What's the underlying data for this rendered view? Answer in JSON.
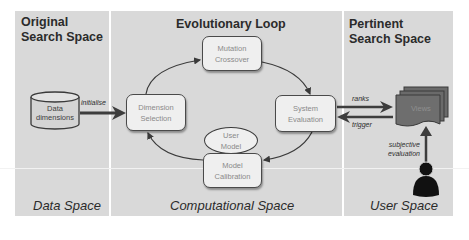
{
  "panels": {
    "data": {
      "title_line1": "Original",
      "title_line2": "Search Space",
      "footer": "Data Space"
    },
    "computational": {
      "title": "Evolutionary Loop",
      "footer": "Computational Space"
    },
    "user": {
      "title_line1": "Pertinent",
      "title_line2": "Search Space",
      "footer": "User Space"
    }
  },
  "nodes": {
    "data_dimensions": {
      "line1": "Data",
      "line2": "dimensions",
      "shape": "cylinder"
    },
    "dimension_selection": {
      "line1": "Dimension",
      "line2": "Selection"
    },
    "mutation_crossover": {
      "line1": "Mutation",
      "line2": "Crossover"
    },
    "system_evaluation": {
      "line1": "System",
      "line2": "Evaluation"
    },
    "user_model": {
      "line1": "User",
      "line2": "Model",
      "shape": "ellipse"
    },
    "model_calibration": {
      "line1": "Model",
      "line2": "Calibration"
    },
    "views": {
      "label": "Views",
      "shape": "stacked-documents"
    },
    "user": {
      "icon": "person-icon"
    }
  },
  "edges": {
    "initialise": "initialise",
    "ranks": "ranks",
    "trigger": "trigger",
    "subjective_line1": "subjective",
    "subjective_line2": "evaluation"
  },
  "colors": {
    "panel_bg": "#d9d9d9",
    "box_bg": "#efefef",
    "views_fill": "#6e6e6e",
    "arrow_thick": "#3d3d3d",
    "person": "#111111"
  }
}
